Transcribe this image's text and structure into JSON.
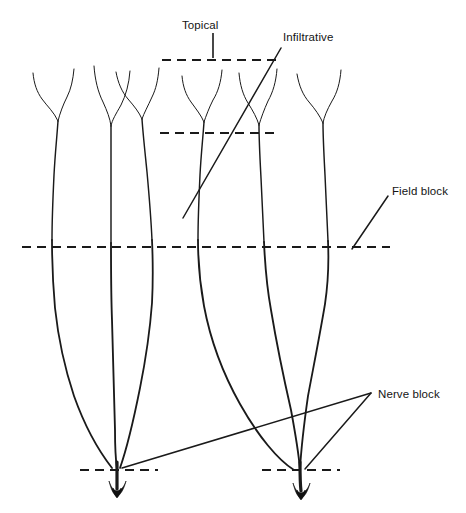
{
  "diagram": {
    "type": "anatomical-line-diagram",
    "width": 466,
    "height": 513,
    "background_color": "#ffffff",
    "ink_color": "#1a1a1a",
    "labels": [
      {
        "id": "topical",
        "text": "Topical",
        "x": 213,
        "y": 26,
        "level_depth": "most superficial",
        "dash_line": {
          "x1": 162,
          "x2": 277,
          "y": 60
        },
        "leader": {
          "type": "vertical-tick",
          "x": 213,
          "y1": 33,
          "y2": 58
        }
      },
      {
        "id": "infiltrative",
        "text": "Infiltrative",
        "x": 283,
        "y": 38,
        "level_depth": "subcutaneous tissue",
        "dash_line": {
          "x1": 160,
          "x2": 278,
          "y": 133
        },
        "leader": {
          "type": "diagonal",
          "x1": 281,
          "y1": 48,
          "x2": 183,
          "y2": 218
        }
      },
      {
        "id": "field-block",
        "text": "Field block",
        "x": 392,
        "y": 192,
        "level_depth": "around the surgical field",
        "dash_line": {
          "x1": 22,
          "x2": 390,
          "y": 247
        },
        "leader": {
          "type": "diagonal",
          "x1": 388,
          "y1": 196,
          "x2": 352,
          "y2": 249
        }
      },
      {
        "id": "nerve-block",
        "text": "Nerve block",
        "x": 378,
        "y": 395,
        "level_depth": "at the nerve trunk",
        "dash_lines": [
          {
            "x1": 80,
            "x2": 158,
            "y": 470
          },
          {
            "x1": 262,
            "x2": 340,
            "y": 470
          }
        ],
        "leaders": [
          {
            "type": "diagonal",
            "x1": 371,
            "y1": 393,
            "x2": 122,
            "y2": 468
          },
          {
            "type": "diagonal",
            "x1": 371,
            "y1": 393,
            "x2": 305,
            "y2": 469
          }
        ]
      }
    ],
    "nerve_groups": [
      {
        "id": "left-nerve",
        "trunk_x": 117,
        "trunk_tip_y": 495,
        "branch_count": 3,
        "convergence": {
          "x": 117,
          "y": 470
        }
      },
      {
        "id": "right-nerve",
        "trunk_x": 300,
        "trunk_tip_y": 497,
        "branch_count": 3,
        "convergence": {
          "x": 300,
          "y": 470
        }
      }
    ],
    "dash_pattern": "9 6"
  }
}
